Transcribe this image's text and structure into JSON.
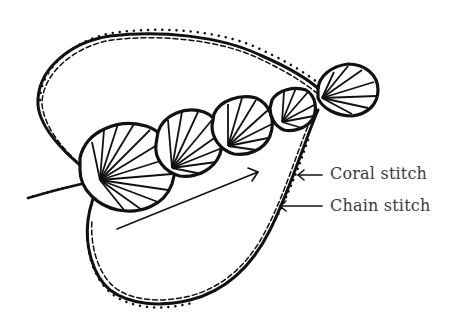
{
  "diagram": {
    "labels": [
      {
        "id": "coral",
        "text": "Coral stitch"
      },
      {
        "id": "chain",
        "text": "Chain stitch"
      }
    ],
    "elements": {
      "motifs": [
        {
          "name": "shell-1",
          "cx": 127,
          "cy": 168,
          "r": 46
        },
        {
          "name": "shell-2",
          "cx": 189,
          "cy": 144,
          "r": 33
        },
        {
          "name": "shell-3",
          "cx": 244,
          "cy": 127,
          "r": 30
        },
        {
          "name": "shell-4",
          "cx": 294,
          "cy": 110,
          "r": 23
        },
        {
          "name": "shell-5",
          "cx": 346,
          "cy": 91,
          "r": 30
        }
      ],
      "direction_arrow": {
        "from": [
          117,
          229
        ],
        "to": [
          258,
          172
        ]
      }
    },
    "colors": {
      "ink": "#111111",
      "label_text": "#3a3a3a",
      "background": "#ffffff"
    }
  }
}
